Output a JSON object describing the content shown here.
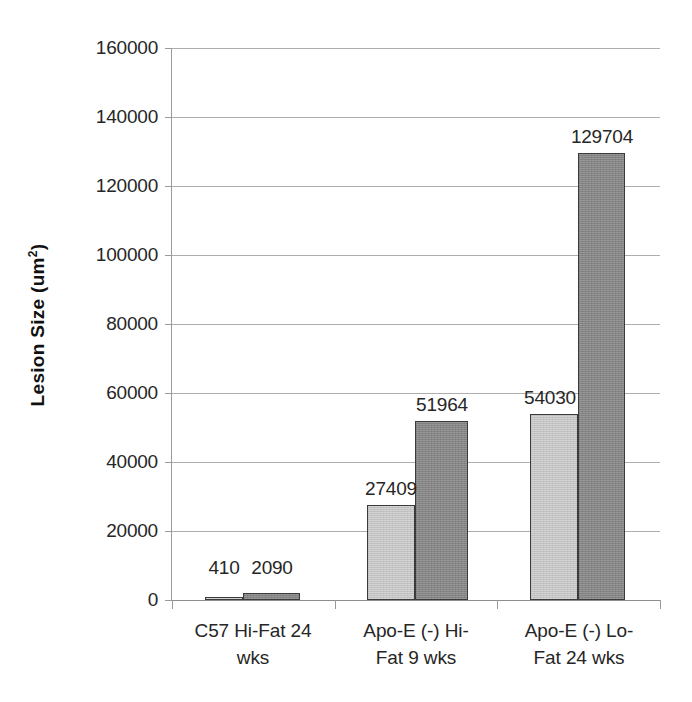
{
  "chart_data": {
    "type": "bar",
    "title": "",
    "xlabel": "",
    "ylabel": "Lesion Size (um2)",
    "ylabel_base": "Lesion Size (um",
    "ylabel_sup": "2",
    "ylabel_close": ")",
    "ylim": [
      0,
      160000
    ],
    "ytick_step": 20000,
    "grid": true,
    "legend": "none",
    "categories": [
      "C57 Hi-Fat 24 wks",
      "Apo-E (-) Hi-Fat 9 wks",
      "Apo-E (-) Lo-Fat 24 wks"
    ],
    "category_lines": [
      [
        "C57 Hi-Fat 24",
        "wks"
      ],
      [
        "Apo-E (-) Hi-",
        "Fat 9 wks"
      ],
      [
        "Apo-E (-) Lo-",
        "Fat 24 wks"
      ]
    ],
    "series": [
      {
        "name": "series-1",
        "color": "#c2c2c2",
        "values": [
          410,
          27409,
          54030
        ],
        "labels": [
          "410",
          "27409",
          "54030"
        ]
      },
      {
        "name": "series-2",
        "color": "#848484",
        "values": [
          2090,
          51964,
          129704
        ],
        "labels": [
          "2090",
          "51964",
          "129704"
        ]
      }
    ],
    "yticks": [
      {
        "value": 160000,
        "label": "160000"
      },
      {
        "value": 140000,
        "label": "140000"
      },
      {
        "value": 120000,
        "label": "120000"
      },
      {
        "value": 100000,
        "label": "100000"
      },
      {
        "value": 80000,
        "label": "80000"
      },
      {
        "value": 60000,
        "label": "60000"
      },
      {
        "value": 40000,
        "label": "40000"
      },
      {
        "value": 20000,
        "label": "20000"
      },
      {
        "value": 0,
        "label": "0"
      }
    ],
    "colors": {
      "light_bar": "#c2c2c2",
      "dark_bar": "#848484",
      "bar_border": "#3b3b3b",
      "gridline": "#adadad",
      "axis": "#9a9a9a",
      "text": "#262626",
      "background": "#ffffff"
    }
  }
}
